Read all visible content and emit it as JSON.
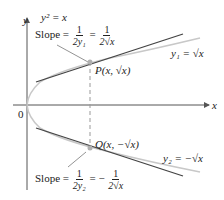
{
  "diagram": {
    "equation": "y² = x",
    "axes": {
      "x_label": "x",
      "y_label": "y",
      "origin_label": "0"
    },
    "upper": {
      "curve_label": "y₁ = √x",
      "point_label": "P(x, √x)",
      "slope_label": "Slope =",
      "slope_frac1": {
        "num": "1",
        "den": "2y₁"
      },
      "eq": "=",
      "slope_frac2": {
        "num": "1",
        "den": "2√x"
      }
    },
    "lower": {
      "curve_label": "y₂ = −√x",
      "point_label": "Q(x, −√x)",
      "slope_label": "Slope =",
      "slope_frac1": {
        "num": "1",
        "den": "2y₂"
      },
      "eq": "= −",
      "slope_frac2": {
        "num": "1",
        "den": "2√x"
      }
    },
    "colors": {
      "axis": "#555555",
      "curve": "#c8c8c8",
      "tangent": "#444444",
      "point": "#b0b0b0",
      "text": "#222222"
    }
  }
}
